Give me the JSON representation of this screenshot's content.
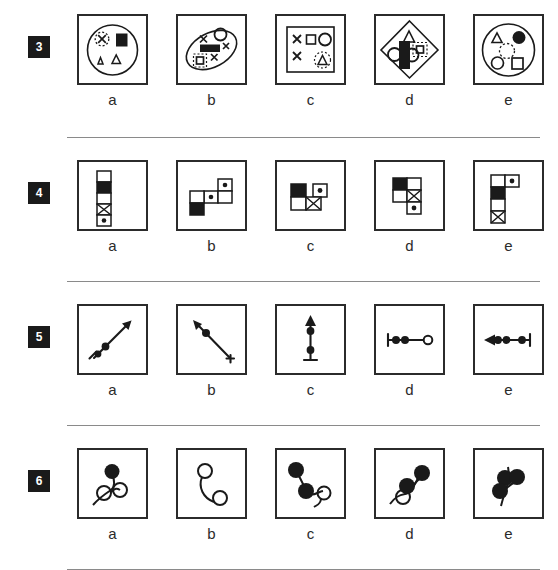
{
  "page": {
    "option_letters": [
      "a",
      "b",
      "c",
      "d",
      "e"
    ],
    "ink_color": "#1a1a1a",
    "box_border_color": "#2b2b2b",
    "divider_color": "#8a8a8a",
    "background_color": "#ffffff"
  },
  "rows": [
    {
      "number": "3",
      "name": "question-3",
      "description": "Large outline circle or ellipse containing small shapes",
      "options": [
        {
          "letter": "a",
          "figure": "circle-outline containing dashed-circle-with-x, black-square, two outline-triangles",
          "shapes": [
            "dashed-circle-x",
            "filled-square",
            "triangle-outline",
            "triangle-outline"
          ]
        },
        {
          "letter": "b",
          "figure": "tilted ellipse containing x marks, outline circle, black rectangle, dashed-square-with-square",
          "shapes": [
            "x-mark",
            "circle-outline",
            "x-mark",
            "filled-rectangle",
            "dashed-square-nested",
            "x-mark"
          ]
        },
        {
          "letter": "c",
          "figure": "square outline containing two x marks, small square, circle, dashed triangle",
          "shapes": [
            "x-mark",
            "x-mark",
            "square-outline",
            "circle-outline",
            "dashed-circle-triangle"
          ]
        },
        {
          "letter": "d",
          "figure": "diamond outline containing triangle, dashed-square-nested, two circles and black rectangle",
          "shapes": [
            "triangle-outline",
            "dashed-square-nested",
            "circle-outline",
            "filled-rectangle",
            "circle-outline"
          ]
        },
        {
          "letter": "e",
          "figure": "circle outline containing triangle, filled circle, dashed circle, circle outline, square outline",
          "shapes": [
            "triangle-outline",
            "filled-circle",
            "dashed-circle",
            "circle-outline",
            "square-outline"
          ]
        }
      ]
    },
    {
      "number": "4",
      "name": "question-4",
      "description": "Polyomino arrangements of small cells, each cell white, black, x-filled or dot-filled",
      "options": [
        {
          "letter": "a",
          "figure": "vertical column of five cells",
          "cells": [
            "white",
            "black",
            "white",
            "x",
            "dot"
          ]
        },
        {
          "letter": "b",
          "figure": "staircase of four cells",
          "cells": [
            "dot",
            "white",
            "dot",
            "black"
          ]
        },
        {
          "letter": "c",
          "figure": "four cells, black top-left with dot cell right, white and x below",
          "cells": [
            "black",
            "dot",
            "white",
            "x"
          ]
        },
        {
          "letter": "d",
          "figure": "four cells, black and white on top, x and dot below",
          "cells": [
            "black",
            "white",
            "white",
            "x",
            "dot"
          ]
        },
        {
          "letter": "e",
          "figure": "vertical column with dot cell offset at top",
          "cells": [
            "white",
            "dot",
            "black",
            "white",
            "x"
          ]
        }
      ]
    },
    {
      "number": "5",
      "name": "question-5",
      "description": "Arrow lines bearing filled and open circles",
      "options": [
        {
          "letter": "a",
          "figure": "diagonal arrow pointing up-right with two filled dots near tail and crossbar tail",
          "direction": "up-right",
          "dots": [
            "filled",
            "filled"
          ]
        },
        {
          "letter": "b",
          "figure": "diagonal arrow pointing up-left with one filled dot near head and crossbar tail",
          "direction": "up-left",
          "dots": [
            "filled"
          ]
        },
        {
          "letter": "c",
          "figure": "vertical arrow pointing up with two filled dots and crossbar tail",
          "direction": "up",
          "dots": [
            "filled",
            "filled"
          ]
        },
        {
          "letter": "d",
          "figure": "horizontal line with crossbar left, two filled dots and open circle at right end",
          "direction": "right-open",
          "dots": [
            "filled",
            "filled",
            "open"
          ]
        },
        {
          "letter": "e",
          "figure": "horizontal arrow pointing left with three filled dots and crossbar tail",
          "direction": "left",
          "dots": [
            "filled",
            "filled",
            "filled"
          ]
        }
      ]
    },
    {
      "number": "6",
      "name": "question-6",
      "description": "Curved stem with filled and open circular blobs",
      "options": [
        {
          "letter": "a",
          "figure": "curve with one filled blob at top and two open circles below",
          "blobs": [
            "filled",
            "open",
            "open"
          ]
        },
        {
          "letter": "b",
          "figure": "curve with two open circles at the ends",
          "blobs": [
            "open",
            "open"
          ]
        },
        {
          "letter": "c",
          "figure": "curve with two filled blobs at upper left and one open circle at right",
          "blobs": [
            "filled",
            "filled",
            "open"
          ]
        },
        {
          "letter": "d",
          "figure": "curve with two filled blobs upper right and one open circle lower left",
          "blobs": [
            "filled",
            "filled",
            "open"
          ]
        },
        {
          "letter": "e",
          "figure": "curve with three filled blobs clustered",
          "blobs": [
            "filled",
            "filled",
            "filled"
          ]
        }
      ]
    }
  ]
}
